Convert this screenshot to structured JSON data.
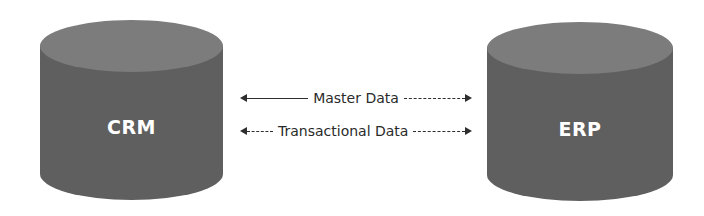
{
  "diagram": {
    "nodes": [
      {
        "id": "crm",
        "label": "CRM",
        "shape": "cylinder"
      },
      {
        "id": "erp",
        "label": "ERP",
        "shape": "cylinder"
      }
    ],
    "edges": [
      {
        "from": "crm",
        "to": "erp",
        "label": "Master Data",
        "direction": "bidirectional"
      },
      {
        "from": "crm",
        "to": "erp",
        "label": "Transactional Data",
        "direction": "bidirectional"
      }
    ],
    "colors": {
      "cylinder_top": "#7c7c7c",
      "cylinder_body": "#5f5f5f",
      "label_text": "#ffffff",
      "arrow": "#2e2e2e"
    }
  }
}
